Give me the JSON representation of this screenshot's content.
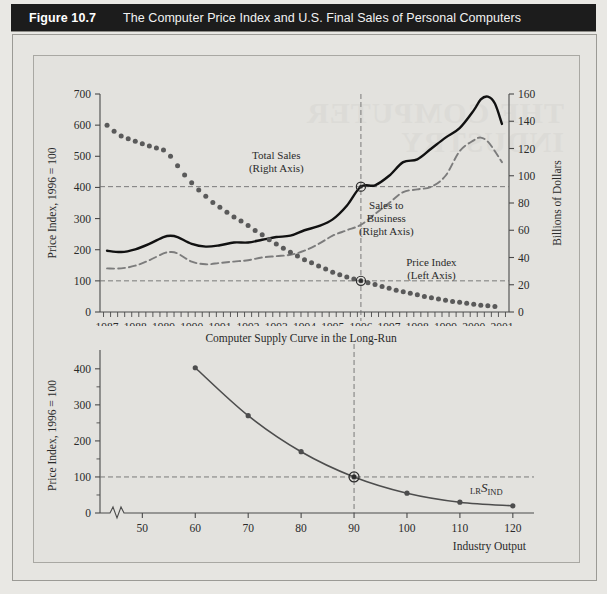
{
  "header": {
    "figure_number": "Figure 10.7",
    "title": "The Computer Price Index and U.S. Final Sales of Personal Computers"
  },
  "watermark_text": "THE COMPUTER\nINDUSTRY",
  "colors": {
    "page_background": "#e9e8e4",
    "panel_background": "#e3e2de",
    "header_bar": "#1c1c1c",
    "header_text": "#ffffff",
    "axis": "#4a4a4a",
    "price_index_series": "#5a5a5a",
    "total_sales_series": "#111111",
    "sales_to_business_series": "#7c7c7c",
    "supply_curve": "#4d4d4d",
    "reference_line": "#6e6e6e"
  },
  "chart_data": [
    {
      "id": "top-chart",
      "type": "line",
      "title": "",
      "xlabel": "",
      "ylabel": "Price Index, 1996 = 100",
      "y2label": "Billions of Dollars",
      "xlim": [
        1986.75,
        2001.25
      ],
      "ylim": [
        0,
        700
      ],
      "y2lim": [
        0,
        160
      ],
      "yticks": [
        0,
        100,
        200,
        300,
        400,
        500,
        600,
        700
      ],
      "y2ticks": [
        0,
        20,
        40,
        60,
        80,
        100,
        120,
        140,
        160
      ],
      "xticks": [
        1987,
        1988,
        1989,
        1990,
        1991,
        1992,
        1993,
        1994,
        1995,
        1996,
        1997,
        1998,
        1999,
        2000,
        2001
      ],
      "xtick_labels": [
        "1987",
        "1988",
        "1989",
        "1990",
        "1991",
        "1992",
        "1993",
        "1994",
        "1995",
        "1996",
        "1997",
        "1998",
        "1999",
        "2000",
        "2001"
      ],
      "minor_xticks_per_year": 4,
      "grid": false,
      "reference_lines": [
        {
          "name": "price-index-100-line",
          "axis": "left",
          "value": 100,
          "style": "dashed"
        },
        {
          "name": "total-sales-1996-line",
          "axis": "right",
          "value": 92,
          "style": "dashed"
        },
        {
          "name": "year-1996-line",
          "axis": "x",
          "value": 1996,
          "style": "dashed"
        }
      ],
      "markers": [
        {
          "name": "total-sales-1996-marker",
          "x": 1996,
          "y": 92,
          "axis": "right"
        },
        {
          "name": "price-index-1996-marker",
          "x": 1996,
          "y": 100,
          "axis": "left"
        }
      ],
      "annotations": [
        {
          "name": "total-sales-label",
          "text": "Total Sales\n(Right Axis)",
          "x": 1993.0,
          "y": 490
        },
        {
          "name": "sales-to-business-label",
          "text": "Sales to\nBusiness\n(Right Axis)",
          "x": 1996.9,
          "y": 330
        },
        {
          "name": "price-index-label",
          "text": "Price Index\n(Left Axis)",
          "x": 1998.5,
          "y": 148
        }
      ],
      "series": [
        {
          "name": "Price Index",
          "axis": "left",
          "style": "dotted-markers",
          "x": [
            1987.0,
            1987.25,
            1987.5,
            1987.75,
            1988.0,
            1988.25,
            1988.5,
            1988.75,
            1989.0,
            1989.25,
            1989.5,
            1989.75,
            1990.0,
            1990.25,
            1990.5,
            1990.75,
            1991.0,
            1991.25,
            1991.5,
            1991.75,
            1992.0,
            1992.25,
            1992.5,
            1992.75,
            1993.0,
            1993.25,
            1993.5,
            1993.75,
            1994.0,
            1994.25,
            1994.5,
            1994.75,
            1995.0,
            1995.25,
            1995.5,
            1995.75,
            1996.0,
            1996.25,
            1996.5,
            1996.75,
            1997.0,
            1997.25,
            1997.5,
            1997.75,
            1998.0,
            1998.25,
            1998.5,
            1998.75,
            1999.0,
            1999.25,
            1999.5,
            1999.75,
            2000.0,
            2000.25,
            2000.5,
            2000.75
          ],
          "values": [
            600,
            580,
            565,
            556,
            548,
            540,
            533,
            527,
            520,
            500,
            470,
            440,
            415,
            392,
            372,
            352,
            336,
            320,
            305,
            292,
            278,
            262,
            248,
            232,
            218,
            205,
            192,
            180,
            168,
            158,
            148,
            138,
            128,
            120,
            112,
            106,
            100,
            94,
            88,
            82,
            76,
            70,
            65,
            60,
            55,
            50,
            46,
            42,
            38,
            34,
            31,
            28,
            25,
            22,
            20,
            18
          ]
        },
        {
          "name": "Total Sales",
          "axis": "right",
          "style": "solid",
          "x": [
            1987.0,
            1987.5,
            1988.0,
            1988.5,
            1989.0,
            1989.25,
            1989.5,
            1990.0,
            1990.5,
            1991.0,
            1991.5,
            1992.0,
            1992.5,
            1993.0,
            1993.5,
            1994.0,
            1994.5,
            1995.0,
            1995.5,
            1996.0,
            1996.5,
            1997.0,
            1997.5,
            1998.0,
            1998.5,
            1999.0,
            1999.5,
            2000.0,
            2000.25,
            2000.5,
            2000.75,
            2001.0
          ],
          "values": [
            45,
            44,
            46,
            50,
            55,
            56,
            55,
            50,
            48,
            49,
            51,
            51,
            53,
            55,
            56,
            60,
            63,
            68,
            78,
            92,
            93,
            100,
            110,
            112,
            120,
            128,
            135,
            148,
            156,
            158,
            153,
            138
          ]
        },
        {
          "name": "Sales to Business",
          "axis": "right",
          "style": "dashed",
          "x": [
            1987.0,
            1987.5,
            1988.0,
            1988.5,
            1989.0,
            1989.25,
            1989.5,
            1990.0,
            1990.5,
            1991.0,
            1991.5,
            1992.0,
            1992.5,
            1993.0,
            1993.5,
            1994.0,
            1994.5,
            1995.0,
            1995.5,
            1996.0,
            1996.5,
            1997.0,
            1997.5,
            1998.0,
            1998.5,
            1999.0,
            1999.5,
            2000.0,
            2000.25,
            2000.5,
            2000.75,
            2001.0
          ],
          "values": [
            32,
            32,
            34,
            38,
            43,
            44,
            43,
            37,
            35,
            36,
            37,
            38,
            40,
            41,
            42,
            45,
            50,
            56,
            60,
            64,
            72,
            80,
            88,
            90,
            92,
            100,
            118,
            126,
            128,
            125,
            118,
            110
          ]
        }
      ]
    },
    {
      "id": "bottom-chart",
      "type": "line",
      "title": "Computer Supply Curve in the Long-Run",
      "xlabel": "Industry Output",
      "ylabel": "Price Index, 1996 = 100",
      "xlim": [
        42,
        124
      ],
      "ylim": [
        0,
        430
      ],
      "yticks": [
        0,
        100,
        200,
        300,
        400
      ],
      "minor_yticks": [
        50,
        150,
        250,
        350
      ],
      "xticks": [
        50,
        60,
        70,
        80,
        90,
        100,
        110,
        120
      ],
      "xtick_labels": [
        "50",
        "60",
        "70",
        "80",
        "90",
        "100",
        "110",
        "120"
      ],
      "axis_break": true,
      "grid": false,
      "reference_lines": [
        {
          "name": "price-100-line",
          "axis": "y",
          "value": 100,
          "style": "dashed"
        },
        {
          "name": "output-90-line",
          "axis": "x",
          "value": 90,
          "style": "dashed"
        }
      ],
      "markers": [
        {
          "name": "equilibrium-marker",
          "x": 90,
          "y": 100
        }
      ],
      "curve_label": {
        "name": "lr-supply-curve-label",
        "prefix": "LR",
        "main": "S",
        "subscript": "IND"
      },
      "series": [
        {
          "name": "LR S_IND",
          "style": "solid-with-points",
          "x": [
            60,
            70,
            80,
            90,
            100,
            110,
            120
          ],
          "values": [
            403,
            270,
            170,
            100,
            55,
            30,
            20
          ]
        }
      ]
    }
  ]
}
